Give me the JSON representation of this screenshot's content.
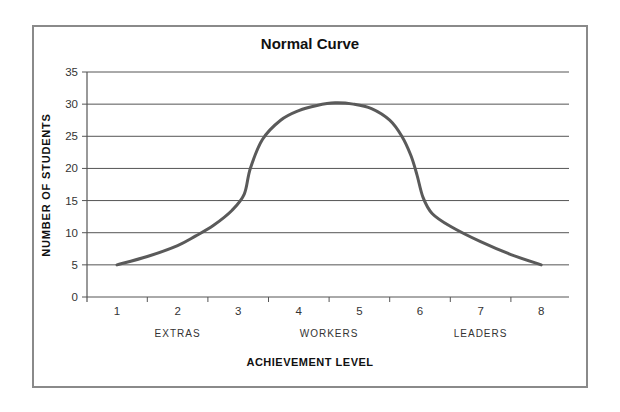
{
  "chart_data": {
    "type": "line",
    "title": "Normal Curve",
    "xlabel": "ACHIEVEMENT LEVEL",
    "ylabel": "NUMBER OF STUDENTS",
    "x_ticks": [
      1,
      2,
      3,
      4,
      5,
      6,
      7,
      8
    ],
    "y_ticks": [
      0,
      5,
      10,
      15,
      20,
      25,
      30,
      35
    ],
    "xlim": [
      0.5,
      8.5
    ],
    "ylim": [
      0,
      35
    ],
    "grid": "horizontal",
    "legend": "none",
    "group_labels": [
      {
        "label": "EXTRAS",
        "x": 2
      },
      {
        "label": "WORKERS",
        "x": 4.5
      },
      {
        "label": "LEADERS",
        "x": 7
      }
    ],
    "series": [
      {
        "name": "Normal Curve",
        "color": "#5a5a5a",
        "points": [
          [
            1.0,
            5.0
          ],
          [
            1.5,
            6.3
          ],
          [
            2.0,
            8.0
          ],
          [
            2.3,
            9.5
          ],
          [
            2.6,
            11.2
          ],
          [
            2.9,
            13.5
          ],
          [
            3.1,
            16.0
          ],
          [
            3.2,
            20.0
          ],
          [
            3.4,
            24.5
          ],
          [
            3.7,
            27.5
          ],
          [
            4.0,
            29.0
          ],
          [
            4.3,
            29.8
          ],
          [
            4.6,
            30.2
          ],
          [
            4.9,
            30.0
          ],
          [
            5.2,
            29.3
          ],
          [
            5.5,
            27.5
          ],
          [
            5.7,
            25.0
          ],
          [
            5.85,
            22.0
          ],
          [
            5.95,
            19.0
          ],
          [
            6.05,
            15.5
          ],
          [
            6.2,
            13.0
          ],
          [
            6.5,
            11.0
          ],
          [
            7.0,
            8.6
          ],
          [
            7.5,
            6.6
          ],
          [
            8.0,
            5.0
          ]
        ]
      }
    ]
  },
  "header": {
    "title": "Normal Curve"
  },
  "axes": {
    "x_title": "ACHIEVEMENT LEVEL",
    "y_title": "NUMBER OF STUDENTS"
  },
  "colors": {
    "curve": "#5a5a5a",
    "gridline": "#555555",
    "frame": "#8a8a8a"
  }
}
